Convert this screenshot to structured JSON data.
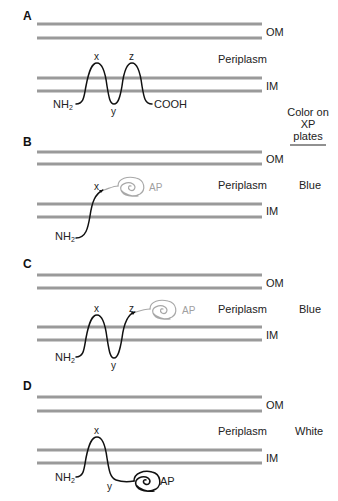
{
  "figure": {
    "column_header": {
      "line1": "Color on",
      "line2": "XP",
      "line3": "plates"
    },
    "labels": {
      "outer_membrane": "OM",
      "inner_membrane": "IM",
      "periplasm": "Periplasm",
      "n_terminus": "NH",
      "n_terminus_sub": "2",
      "c_terminus": "COOH",
      "alkaline_phosphatase": "AP",
      "loop_x": "x",
      "loop_y": "y",
      "loop_z": "z"
    },
    "panels": [
      {
        "letter": "A",
        "color_result": ""
      },
      {
        "letter": "B",
        "color_result": "Blue"
      },
      {
        "letter": "C",
        "color_result": "Blue"
      },
      {
        "letter": "D",
        "color_result": "White"
      }
    ],
    "colors": {
      "membrane": "#9a9a9a",
      "chain": "#111111",
      "ap_exported": "#a8a8a8",
      "ap_cytoplasmic": "#111111"
    }
  }
}
